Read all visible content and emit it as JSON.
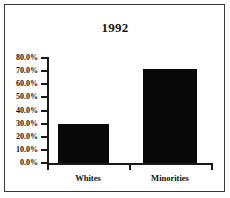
{
  "chart_data": {
    "type": "bar",
    "title": "1992",
    "xlabel": "",
    "ylabel": "",
    "categories": [
      "Whites",
      "Minorities"
    ],
    "values": [
      29.5,
      71.5
    ],
    "value_labels": [
      "",
      ""
    ],
    "ylim": [
      0,
      80
    ],
    "ytick_values": [
      0,
      10,
      20,
      30,
      40,
      50,
      60,
      70,
      80
    ],
    "ytick_labels": [
      "0.0%",
      "10.0%",
      "20.0%",
      "30.0%",
      "40.0%",
      "50.0%",
      "60.0%",
      "70.0%",
      "80.0%"
    ],
    "grid": false,
    "legend": false,
    "legend_position": "none",
    "bar_color": "#080808",
    "axis_color": "#1a1a1a",
    "background_color": "#ffffff",
    "frame_color": "#3a3a3a"
  }
}
